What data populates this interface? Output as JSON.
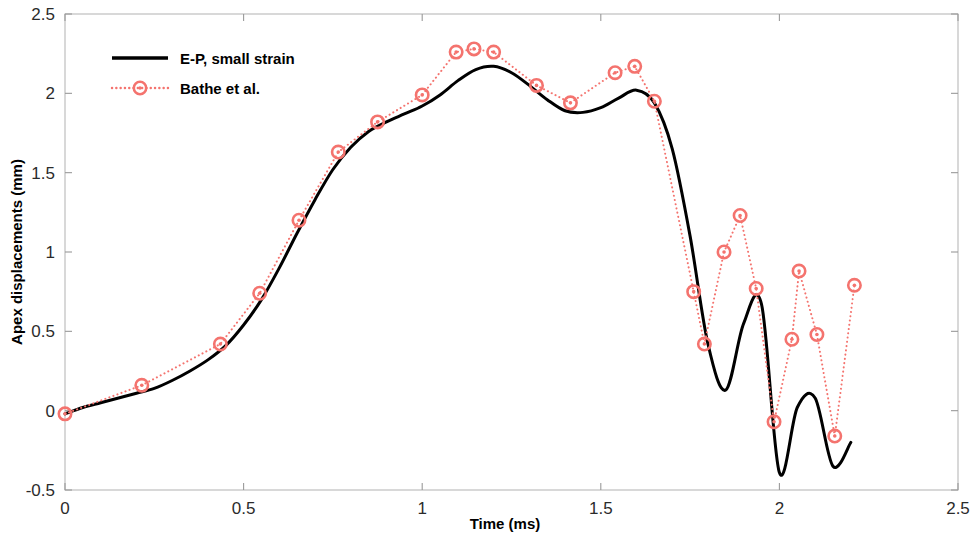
{
  "chart_data": {
    "type": "line",
    "title": "",
    "xlabel": "Time (ms)",
    "ylabel": "Apex displacements (mm)",
    "xlim": [
      0,
      2.5
    ],
    "ylim": [
      -0.5,
      2.5
    ],
    "xticks": [
      0,
      0.5,
      1,
      1.5,
      2,
      2.5
    ],
    "xtick_labels": [
      "0",
      "0.5",
      "1",
      "1.5",
      "2",
      "2.5"
    ],
    "yticks": [
      -0.5,
      0,
      0.5,
      1,
      1.5,
      2,
      2.5
    ],
    "ytick_labels": [
      "-0.5",
      "0",
      "0.5",
      "1",
      "1.5",
      "2",
      "2.5"
    ],
    "grid": false,
    "legend_position": "upper left",
    "series": [
      {
        "name": "E-P, small strain",
        "style": "solid",
        "color": "#000000",
        "marker": "none",
        "linewidth": 3,
        "x": [
          0.0,
          0.05,
          0.1,
          0.15,
          0.2,
          0.25,
          0.3,
          0.35,
          0.4,
          0.45,
          0.5,
          0.55,
          0.6,
          0.65,
          0.7,
          0.75,
          0.8,
          0.85,
          0.9,
          0.95,
          1.0,
          1.05,
          1.1,
          1.15,
          1.2,
          1.25,
          1.3,
          1.35,
          1.4,
          1.45,
          1.5,
          1.55,
          1.6,
          1.65,
          1.7,
          1.75,
          1.8,
          1.85,
          1.9,
          1.95,
          2.0,
          2.05,
          2.1,
          2.15,
          2.2
        ],
        "y": [
          -0.02,
          0.02,
          0.05,
          0.08,
          0.11,
          0.14,
          0.19,
          0.25,
          0.32,
          0.41,
          0.54,
          0.7,
          0.9,
          1.12,
          1.33,
          1.52,
          1.66,
          1.76,
          1.82,
          1.87,
          1.92,
          1.99,
          2.08,
          2.15,
          2.17,
          2.13,
          2.05,
          1.96,
          1.89,
          1.88,
          1.91,
          1.97,
          2.02,
          1.94,
          1.65,
          1.1,
          0.42,
          0.13,
          0.55,
          0.67,
          -0.39,
          0.02,
          0.08,
          -0.35,
          -0.2
        ]
      },
      {
        "name": "Bathe et al.",
        "style": "dotted",
        "color": "#f4736e",
        "marker": "circle",
        "linewidth": 2,
        "x": [
          0.0,
          0.215,
          0.435,
          0.545,
          0.655,
          0.765,
          0.875,
          1.0,
          1.095,
          1.145,
          1.2,
          1.32,
          1.415,
          1.54,
          1.595,
          1.65,
          1.76,
          1.79,
          1.845,
          1.89,
          1.935,
          1.985,
          2.035,
          2.055,
          2.105,
          2.155,
          2.21
        ],
        "y": [
          -0.02,
          0.16,
          0.42,
          0.74,
          1.2,
          1.63,
          1.82,
          1.99,
          2.26,
          2.28,
          2.26,
          2.05,
          1.94,
          2.13,
          2.17,
          1.95,
          0.75,
          0.42,
          1.0,
          1.23,
          0.77,
          -0.07,
          0.45,
          0.88,
          0.48,
          -0.16,
          0.79
        ]
      }
    ]
  },
  "axis": {
    "xlabel": "Time (ms)",
    "ylabel": "Apex displacements (mm)"
  },
  "legend": {
    "items": [
      {
        "label": "E-P, small strain",
        "style": "solid",
        "color": "#000000"
      },
      {
        "label": "Bathe et al.",
        "style": "dotted-marker",
        "color": "#f4736e"
      }
    ]
  }
}
